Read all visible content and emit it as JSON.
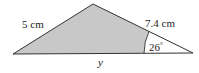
{
  "diagram": {
    "type": "triangle",
    "vertices": {
      "left": [
        13,
        54
      ],
      "apex": [
        93,
        4
      ],
      "right": [
        193,
        53
      ]
    },
    "fill_color": "#c8c8c8",
    "stroke_color": "#333333",
    "labels": {
      "left_side": "5 cm",
      "right_side": "7.4 cm",
      "base": "y",
      "angle": "26",
      "angle_unit": "°"
    },
    "sector": {
      "center": [
        193,
        53
      ],
      "radius": 49,
      "fill_color": "#ffffff"
    }
  }
}
